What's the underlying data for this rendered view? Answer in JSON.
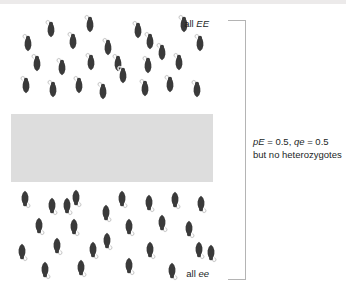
{
  "figure": {
    "width": 346,
    "height": 298,
    "background_color": "#ffffff",
    "mouse_color": "#3a3a3a",
    "tail_color": "#f2f2f2",
    "barrier_color": "#dddddd",
    "bracket_color": "#b4b4b4",
    "text_color": "#221f1f"
  },
  "labels": {
    "top": {
      "prefix": "all ",
      "allele": "EE"
    },
    "bottom": {
      "prefix": "all ",
      "allele": "ee"
    }
  },
  "caption": {
    "line1": {
      "p_symbol": "pE",
      "p_eq": " = 0.5, ",
      "q_symbol": "qe",
      "q_eq": " = 0.5"
    },
    "line2": "but no heterozygotes"
  },
  "barrier": {
    "x": 11,
    "y": 114,
    "width": 202,
    "height": 68
  },
  "bracket": {
    "x": 228,
    "y": 20,
    "width": 17,
    "height": 258
  },
  "populations": [
    {
      "name": "upper-population",
      "genotype": "EE",
      "orientation": "up",
      "count": 24,
      "mice": [
        {
          "x": 44,
          "y": 19
        },
        {
          "x": 83,
          "y": 14
        },
        {
          "x": 131,
          "y": 20
        },
        {
          "x": 177,
          "y": 14
        },
        {
          "x": 21,
          "y": 33
        },
        {
          "x": 101,
          "y": 37
        },
        {
          "x": 66,
          "y": 31
        },
        {
          "x": 143,
          "y": 31
        },
        {
          "x": 193,
          "y": 33
        },
        {
          "x": 155,
          "y": 42
        },
        {
          "x": 30,
          "y": 53
        },
        {
          "x": 55,
          "y": 57
        },
        {
          "x": 84,
          "y": 52
        },
        {
          "x": 111,
          "y": 53
        },
        {
          "x": 141,
          "y": 55
        },
        {
          "x": 172,
          "y": 52
        },
        {
          "x": 116,
          "y": 65
        },
        {
          "x": 19,
          "y": 75
        },
        {
          "x": 46,
          "y": 79
        },
        {
          "x": 72,
          "y": 75
        },
        {
          "x": 96,
          "y": 81
        },
        {
          "x": 138,
          "y": 78
        },
        {
          "x": 163,
          "y": 74
        },
        {
          "x": 190,
          "y": 79
        }
      ]
    },
    {
      "name": "lower-population",
      "genotype": "ee",
      "orientation": "down",
      "count": 25,
      "mice": [
        {
          "x": 18,
          "y": 189
        },
        {
          "x": 45,
          "y": 196
        },
        {
          "x": 69,
          "y": 188
        },
        {
          "x": 115,
          "y": 189
        },
        {
          "x": 142,
          "y": 193
        },
        {
          "x": 168,
          "y": 190
        },
        {
          "x": 194,
          "y": 194
        },
        {
          "x": 99,
          "y": 203
        },
        {
          "x": 32,
          "y": 216
        },
        {
          "x": 67,
          "y": 217
        },
        {
          "x": 122,
          "y": 217
        },
        {
          "x": 155,
          "y": 213
        },
        {
          "x": 182,
          "y": 219
        },
        {
          "x": 100,
          "y": 231
        },
        {
          "x": 50,
          "y": 236
        },
        {
          "x": 15,
          "y": 242
        },
        {
          "x": 143,
          "y": 240
        },
        {
          "x": 192,
          "y": 240
        },
        {
          "x": 38,
          "y": 260
        },
        {
          "x": 74,
          "y": 258
        },
        {
          "x": 122,
          "y": 256
        },
        {
          "x": 165,
          "y": 261
        },
        {
          "x": 204,
          "y": 243
        },
        {
          "x": 86,
          "y": 240
        },
        {
          "x": 60,
          "y": 196
        }
      ]
    }
  ]
}
